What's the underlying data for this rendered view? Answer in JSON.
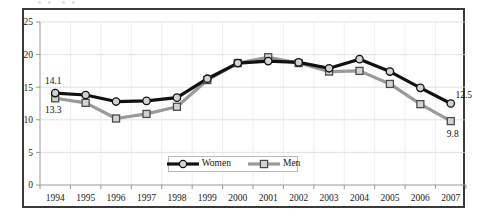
{
  "chart_data": {
    "type": "line",
    "title": "",
    "subtitle": "",
    "xlabel": "",
    "ylabel": "",
    "categories": [
      "1994",
      "1995",
      "1996",
      "1997",
      "1998",
      "1999",
      "2000",
      "2001",
      "2002",
      "2003",
      "2004",
      "2005",
      "2006",
      "2007"
    ],
    "series": [
      {
        "name": "Women",
        "color": "#111111",
        "marker": "circle",
        "values": [
          14.1,
          13.8,
          12.8,
          12.9,
          13.4,
          16.3,
          18.7,
          19.0,
          18.8,
          17.9,
          19.3,
          17.4,
          14.9,
          12.5
        ]
      },
      {
        "name": "Men",
        "color": "#9a9a9a",
        "marker": "square",
        "values": [
          13.3,
          12.6,
          10.2,
          10.9,
          12.0,
          16.1,
          18.7,
          19.6,
          18.7,
          17.4,
          17.5,
          15.5,
          12.4,
          9.8
        ]
      }
    ],
    "ylim": [
      0,
      25
    ],
    "yticks": [
      0,
      5,
      10,
      15,
      20,
      25
    ],
    "ytick_labels": [
      "0",
      "5",
      "10",
      "15",
      "20",
      "25"
    ],
    "grid": {
      "horizontal": true,
      "vertical": true,
      "color": "#d9d9d9"
    },
    "legend": {
      "position": "inside-bottom-center",
      "entries": [
        {
          "label": "Women",
          "color": "#111111",
          "marker": "circle"
        },
        {
          "label": "Men",
          "color": "#9a9a9a",
          "marker": "square"
        }
      ]
    },
    "annotations": [
      {
        "text": "14.1",
        "series": "Women",
        "category": "1994",
        "value": 14.1,
        "placement": "above-left"
      },
      {
        "text": "13.3",
        "series": "Men",
        "category": "1994",
        "value": 13.3,
        "placement": "below-left"
      },
      {
        "text": "12.5",
        "series": "Women",
        "category": "2007",
        "value": 12.5,
        "placement": "above-right"
      },
      {
        "text": "9.8",
        "series": "Men",
        "category": "2007",
        "value": 9.8,
        "placement": "below-right"
      }
    ],
    "frame": {
      "border_color": "#3a3a3a",
      "background": "#ffffff"
    }
  }
}
